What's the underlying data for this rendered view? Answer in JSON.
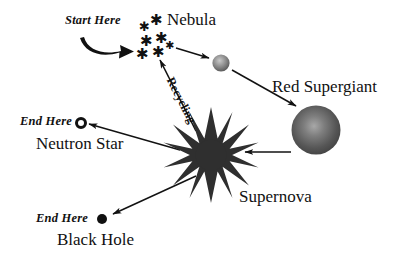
{
  "diagram": {
    "background_color": "#ffffff",
    "ink_color": "#111111"
  },
  "labels": {
    "start_here": "Start Here",
    "nebula": "Nebula",
    "red_supergiant": "Red Supergiant",
    "supernova": "Supernova",
    "recycling": "Recycling",
    "end_here_neutron": "End Here",
    "neutron_star": "Neutron Star",
    "end_here_blackhole": "End Here",
    "black_hole": "Black Hole"
  },
  "nodes": [
    {
      "id": "nebula",
      "label": "Nebula",
      "kind": "star-cluster",
      "count": 7
    },
    {
      "id": "star",
      "label": "",
      "kind": "sphere",
      "diameter": 17,
      "color": "#6f6f6f"
    },
    {
      "id": "red-supergiant",
      "label": "Red Supergiant",
      "kind": "sphere",
      "diameter": 49,
      "color": "#4a4a4a"
    },
    {
      "id": "supernova",
      "label": "Supernova",
      "kind": "starburst",
      "points": 14,
      "color": "#2b2b2b"
    },
    {
      "id": "neutron-star",
      "label": "Neutron Star",
      "kind": "ring",
      "diameter": 11
    },
    {
      "id": "black-hole",
      "label": "Black Hole",
      "kind": "filled-dot",
      "diameter": 10
    }
  ],
  "edges": [
    {
      "from": "start",
      "to": "nebula",
      "style": "thick-curved-arrow",
      "label": "Start Here"
    },
    {
      "from": "nebula",
      "to": "star",
      "style": "thin-arrow",
      "label": ""
    },
    {
      "from": "star",
      "to": "red-supergiant",
      "style": "thin-arrow",
      "label": ""
    },
    {
      "from": "red-supergiant",
      "to": "supernova",
      "style": "thin-arrow",
      "label": ""
    },
    {
      "from": "supernova",
      "to": "neutron-star",
      "style": "thin-arrow",
      "label": ""
    },
    {
      "from": "supernova",
      "to": "black-hole",
      "style": "thin-arrow",
      "label": ""
    },
    {
      "from": "supernova",
      "to": "nebula",
      "style": "thin-arrow",
      "label": "Recycling"
    }
  ],
  "nebula_stars": [
    {
      "x": 141,
      "y": 26,
      "size": 13
    },
    {
      "x": 152,
      "y": 20,
      "size": 15
    },
    {
      "x": 143,
      "y": 40,
      "size": 15
    },
    {
      "x": 157,
      "y": 38,
      "size": 15
    },
    {
      "x": 139,
      "y": 53,
      "size": 15
    },
    {
      "x": 155,
      "y": 52,
      "size": 15
    },
    {
      "x": 166,
      "y": 46,
      "size": 11
    }
  ]
}
